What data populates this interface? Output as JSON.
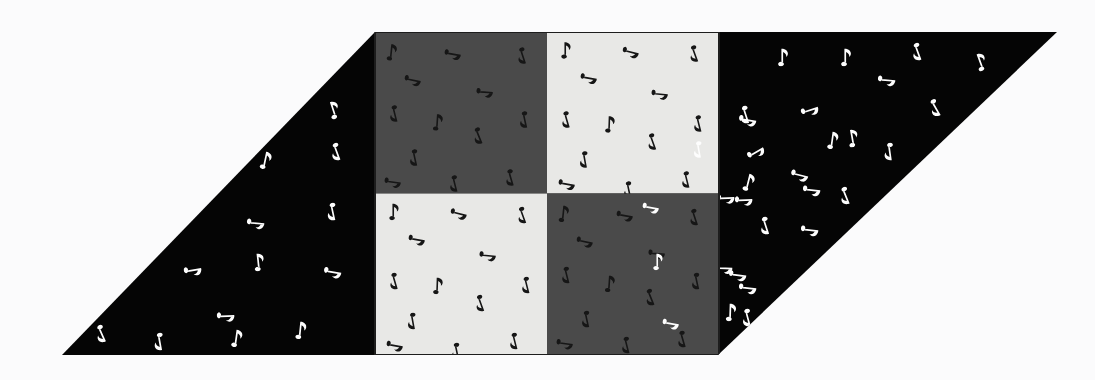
{
  "canvas": {
    "width": 1095,
    "height": 380,
    "background_color": "#fbfbfc",
    "description": "Parallelogram-shaped visual-search / texture-segregation stimulus filled with eighth-note (quaver) glyphs. A 2x2 checkerboard of grey squares is inset in the middle of the parallelogram."
  },
  "palette": {
    "background": "#fbfbfc",
    "black_field": "#050505",
    "dark_grey_tile": "#4a4a4a",
    "light_grey_tile": "#e8e8e6",
    "white_note": "#fdfdfd",
    "dark_note": "#161616",
    "tile_border": "#1d1d1d"
  },
  "shapes": {
    "parallelogram": {
      "name": "parallelogram-field",
      "fill": "#050505",
      "points": "375,32 1057,32 718,355 62,355",
      "top_left": [
        375,
        32
      ],
      "top_right": [
        1057,
        32
      ],
      "bottom_right": [
        718,
        355
      ],
      "bottom_left": [
        62,
        355
      ]
    },
    "checkerboard": {
      "name": "checkerboard-inset",
      "x": 375,
      "y": 32,
      "width": 344,
      "height": 323,
      "rows": 2,
      "cols": 2,
      "cell_width": 172,
      "cell_height": 161.5,
      "tiles": [
        {
          "row": 0,
          "col": 0,
          "tone": "dark",
          "fill": "#4a4a4a",
          "note_color": "#161616",
          "label": "top-left-dark-tile"
        },
        {
          "row": 0,
          "col": 1,
          "tone": "light",
          "fill": "#e8e8e6",
          "note_color": "#161616",
          "label": "top-right-light-tile"
        },
        {
          "row": 1,
          "col": 0,
          "tone": "light",
          "fill": "#e8e8e6",
          "note_color": "#161616",
          "label": "bottom-left-light-tile"
        },
        {
          "row": 1,
          "col": 1,
          "tone": "dark",
          "fill": "#4a4a4a",
          "note_color": "#161616",
          "label": "bottom-right-dark-tile"
        }
      ]
    }
  },
  "glyph": {
    "name": "eighth-note",
    "unicode": "♪",
    "description": "Filled oval notehead with vertical stem and a single flag",
    "nominal_size": 17
  },
  "notes": {
    "black_field_white_notes": [
      {
        "x": 333,
        "y": 110,
        "r": -18
      },
      {
        "x": 265,
        "y": 160,
        "r": 12
      },
      {
        "x": 337,
        "y": 152,
        "r": 160
      },
      {
        "x": 256,
        "y": 223,
        "r": 95
      },
      {
        "x": 333,
        "y": 212,
        "r": 168
      },
      {
        "x": 193,
        "y": 270,
        "r": 80
      },
      {
        "x": 258,
        "y": 262,
        "r": -6
      },
      {
        "x": 333,
        "y": 272,
        "r": 100
      },
      {
        "x": 226,
        "y": 316,
        "r": 88
      },
      {
        "x": 102,
        "y": 334,
        "r": 156
      },
      {
        "x": 160,
        "y": 342,
        "r": 170
      },
      {
        "x": 236,
        "y": 338,
        "r": 8
      },
      {
        "x": 300,
        "y": 330,
        "r": 6
      },
      {
        "x": 748,
        "y": 120,
        "r": 100
      },
      {
        "x": 744,
        "y": 200,
        "r": 88
      },
      {
        "x": 738,
        "y": 275,
        "r": 98
      },
      {
        "x": 748,
        "y": 318,
        "r": 165
      },
      {
        "x": 782,
        "y": 57,
        "r": 0
      },
      {
        "x": 845,
        "y": 57,
        "r": 0
      },
      {
        "x": 918,
        "y": 52,
        "r": 160
      },
      {
        "x": 980,
        "y": 62,
        "r": -20
      },
      {
        "x": 887,
        "y": 80,
        "r": 95
      },
      {
        "x": 746,
        "y": 115,
        "r": 162
      },
      {
        "x": 810,
        "y": 110,
        "r": 72
      },
      {
        "x": 936,
        "y": 108,
        "r": 150
      },
      {
        "x": 756,
        "y": 152,
        "r": 60
      },
      {
        "x": 832,
        "y": 140,
        "r": 8
      },
      {
        "x": 852,
        "y": 138,
        "r": -10
      },
      {
        "x": 890,
        "y": 152,
        "r": 172
      },
      {
        "x": 748,
        "y": 182,
        "r": 14
      },
      {
        "x": 800,
        "y": 175,
        "r": 104
      },
      {
        "x": 812,
        "y": 190,
        "r": 96
      },
      {
        "x": 726,
        "y": 198,
        "r": 88
      },
      {
        "x": 846,
        "y": 196,
        "r": 158
      },
      {
        "x": 766,
        "y": 226,
        "r": 162
      },
      {
        "x": 810,
        "y": 230,
        "r": 96
      },
      {
        "x": 724,
        "y": 268,
        "r": 92
      },
      {
        "x": 748,
        "y": 288,
        "r": 96
      },
      {
        "x": 730,
        "y": 312,
        "r": 2
      }
    ],
    "light_tile_dark_notes": [
      {
        "x": 18,
        "y": 18,
        "r": 0
      },
      {
        "x": 84,
        "y": 20,
        "r": 104
      },
      {
        "x": 148,
        "y": 22,
        "r": 160
      },
      {
        "x": 42,
        "y": 46,
        "r": 100
      },
      {
        "x": 113,
        "y": 62,
        "r": 96
      },
      {
        "x": 20,
        "y": 88,
        "r": 164
      },
      {
        "x": 62,
        "y": 92,
        "r": 2
      },
      {
        "x": 152,
        "y": 92,
        "r": 166
      },
      {
        "x": 106,
        "y": 110,
        "r": 160
      },
      {
        "x": 38,
        "y": 128,
        "r": 170
      },
      {
        "x": 20,
        "y": 152,
        "r": 100
      },
      {
        "x": 82,
        "y": 158,
        "r": 168
      },
      {
        "x": 140,
        "y": 148,
        "r": 166
      }
    ],
    "dark_tile_dark_notes": [
      {
        "x": 16,
        "y": 20,
        "r": 6
      },
      {
        "x": 78,
        "y": 22,
        "r": 100
      },
      {
        "x": 148,
        "y": 24,
        "r": 162
      },
      {
        "x": 38,
        "y": 48,
        "r": 102
      },
      {
        "x": 110,
        "y": 60,
        "r": 94
      },
      {
        "x": 20,
        "y": 82,
        "r": 166
      },
      {
        "x": 62,
        "y": 90,
        "r": 4
      },
      {
        "x": 150,
        "y": 88,
        "r": 168
      },
      {
        "x": 104,
        "y": 104,
        "r": 158
      },
      {
        "x": 40,
        "y": 126,
        "r": 168
      },
      {
        "x": 18,
        "y": 150,
        "r": 98
      },
      {
        "x": 80,
        "y": 152,
        "r": 166
      },
      {
        "x": 136,
        "y": 146,
        "r": 164
      }
    ],
    "light_tile_white_odd": [
      {
        "x": 152,
        "y": 118,
        "r": 170
      }
    ],
    "dark_tile_white_odd": [
      {
        "x": 104,
        "y": 14,
        "r": 100
      },
      {
        "x": 110,
        "y": 68,
        "r": 0
      },
      {
        "x": 124,
        "y": 130,
        "r": 100
      }
    ]
  },
  "counts": {
    "black_field_notes": 39,
    "notes_per_tile": 13,
    "white_oddballs_light_tile": 1,
    "white_oddballs_dark_tile": 3
  }
}
